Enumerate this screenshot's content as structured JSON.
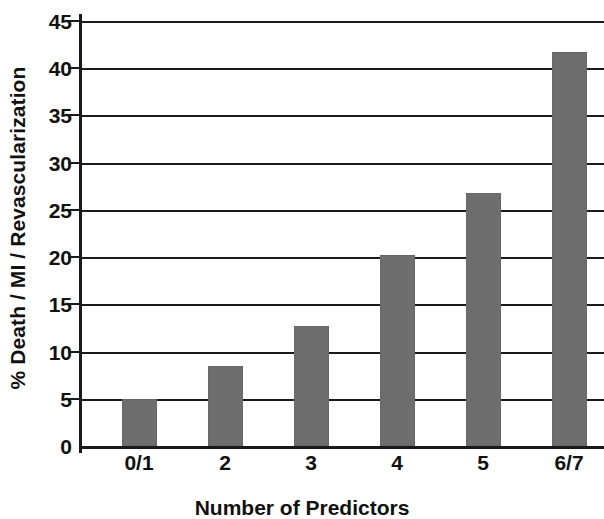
{
  "chart_data": {
    "type": "bar",
    "title": "",
    "subtitle": "",
    "xlabel": "Number of Predictors",
    "ylabel": "% Death / MI / Revascularization",
    "categories": [
      "0/1",
      "2",
      "3",
      "4",
      "5",
      "6/7"
    ],
    "values": [
      5.0,
      8.5,
      12.7,
      20.2,
      26.8,
      41.7
    ],
    "series": [
      {
        "name": "% Death / MI / Revascularization",
        "values": [
          5.0,
          8.5,
          12.7,
          20.2,
          26.8,
          41.7
        ]
      }
    ],
    "ylim": [
      0,
      45
    ],
    "ytick_step": 5,
    "yticks": [
      "0",
      "5",
      "10",
      "15",
      "20",
      "25",
      "30",
      "35",
      "40",
      "45"
    ],
    "ytick_values": [
      0,
      5,
      10,
      15,
      20,
      25,
      30,
      35,
      40,
      45
    ],
    "grid": "horizontal",
    "legend": "none",
    "annotations": [],
    "bar_color": "#6e6e6e",
    "axis_color": "#1a1a1a",
    "background_color": "#ffffff"
  }
}
